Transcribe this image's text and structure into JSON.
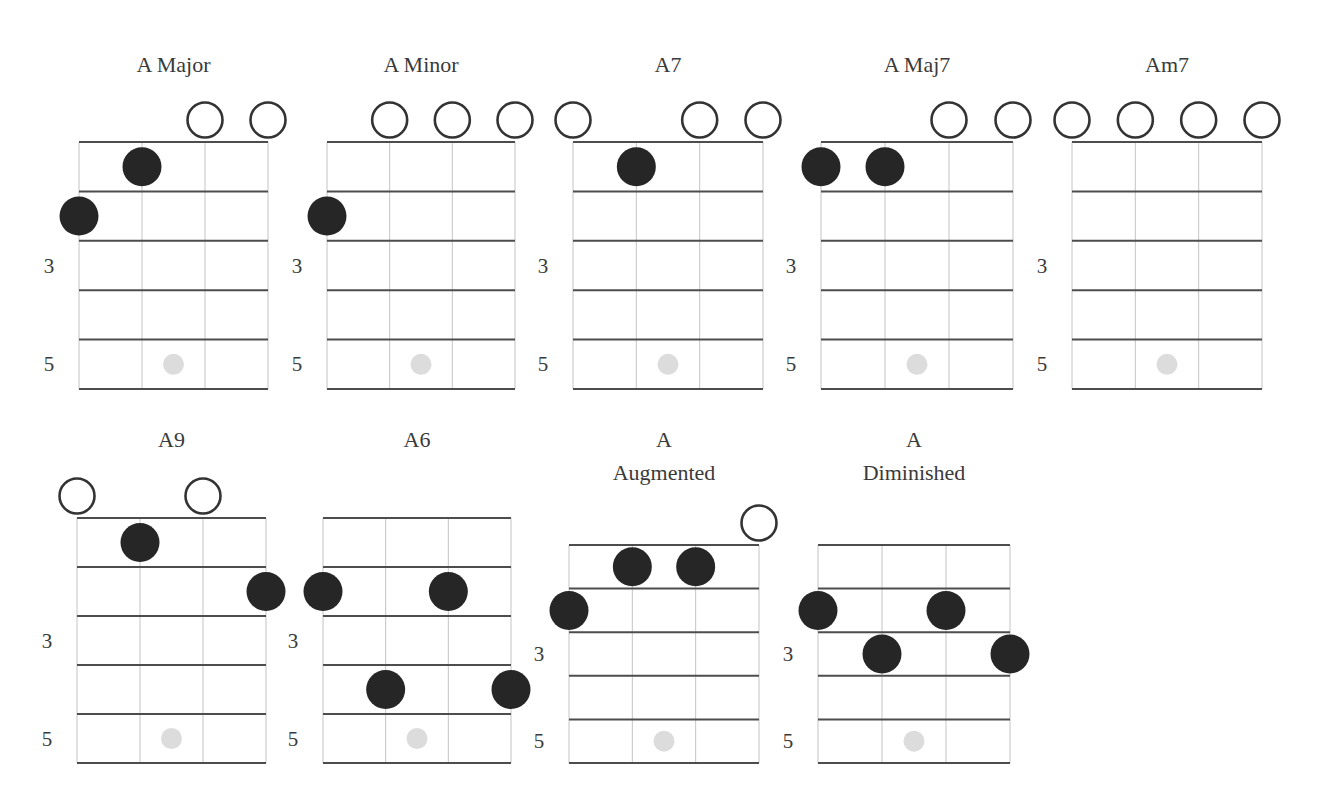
{
  "colors": {
    "background": "#ffffff",
    "text": "#3a3a3a",
    "fret_line": "#4d4d4d",
    "string_line": "#c4c4c4",
    "finger_dot": "#262626",
    "open_circle_stroke": "#333333",
    "fret_marker": "#dcdcdc"
  },
  "legend": {
    "filled_circle": "finger position (string, fret)",
    "open_circle": "open string",
    "gray_dot": "fret 5 position marker"
  },
  "fret_labels": [
    "3",
    "5"
  ],
  "chords": [
    {
      "name": "A Major",
      "title_lines": [
        "A Major"
      ],
      "open_strings": [
        3,
        4
      ],
      "fingers": [
        {
          "string": 2,
          "fret": 1
        },
        {
          "string": 1,
          "fret": 2
        }
      ],
      "layout": {
        "left": 79,
        "right": 268,
        "top": 142,
        "fret_h": 49.4,
        "title_y": 72
      }
    },
    {
      "name": "A Minor",
      "title_lines": [
        "A Minor"
      ],
      "open_strings": [
        2,
        3,
        4
      ],
      "fingers": [
        {
          "string": 1,
          "fret": 2
        }
      ],
      "layout": {
        "left": 327,
        "right": 515,
        "top": 142,
        "fret_h": 49.4,
        "title_y": 72
      }
    },
    {
      "name": "A7",
      "title_lines": [
        "A7"
      ],
      "open_strings": [
        1,
        3,
        4
      ],
      "fingers": [
        {
          "string": 2,
          "fret": 1
        }
      ],
      "layout": {
        "left": 573,
        "right": 763,
        "top": 142,
        "fret_h": 49.4,
        "title_y": 72
      }
    },
    {
      "name": "A Maj7",
      "title_lines": [
        "A Maj7"
      ],
      "open_strings": [
        3,
        4
      ],
      "fingers": [
        {
          "string": 1,
          "fret": 1
        },
        {
          "string": 2,
          "fret": 1
        }
      ],
      "layout": {
        "left": 821,
        "right": 1013,
        "top": 142,
        "fret_h": 49.4,
        "title_y": 72
      }
    },
    {
      "name": "Am7",
      "title_lines": [
        "Am7"
      ],
      "open_strings": [
        1,
        2,
        3,
        4
      ],
      "fingers": [],
      "layout": {
        "left": 1072,
        "right": 1262,
        "top": 142,
        "fret_h": 49.4,
        "title_y": 72
      }
    },
    {
      "name": "A9",
      "title_lines": [
        "A9"
      ],
      "open_strings": [
        1,
        3
      ],
      "fingers": [
        {
          "string": 2,
          "fret": 1
        },
        {
          "string": 4,
          "fret": 2
        }
      ],
      "layout": {
        "left": 77,
        "right": 266,
        "top": 518,
        "fret_h": 49.0,
        "title_y": 447
      }
    },
    {
      "name": "A6",
      "title_lines": [
        "A6"
      ],
      "open_strings": [],
      "fingers": [
        {
          "string": 1,
          "fret": 2
        },
        {
          "string": 3,
          "fret": 2
        },
        {
          "string": 2,
          "fret": 4
        },
        {
          "string": 4,
          "fret": 4
        }
      ],
      "layout": {
        "left": 323,
        "right": 511,
        "top": 518,
        "fret_h": 49.0,
        "title_y": 447
      }
    },
    {
      "name": "A Augmented",
      "title_lines": [
        "A",
        "Augmented"
      ],
      "open_strings": [
        4
      ],
      "fingers": [
        {
          "string": 2,
          "fret": 1
        },
        {
          "string": 3,
          "fret": 1
        },
        {
          "string": 1,
          "fret": 2
        }
      ],
      "layout": {
        "left": 569,
        "right": 759,
        "top": 545,
        "fret_h": 43.6,
        "title_y": 447
      }
    },
    {
      "name": "A Diminished",
      "title_lines": [
        "A",
        "Diminished"
      ],
      "open_strings": [],
      "fingers": [
        {
          "string": 1,
          "fret": 2
        },
        {
          "string": 3,
          "fret": 2
        },
        {
          "string": 2,
          "fret": 3
        },
        {
          "string": 4,
          "fret": 3
        }
      ],
      "layout": {
        "left": 818,
        "right": 1010,
        "top": 545,
        "fret_h": 43.6,
        "title_y": 447
      }
    }
  ]
}
